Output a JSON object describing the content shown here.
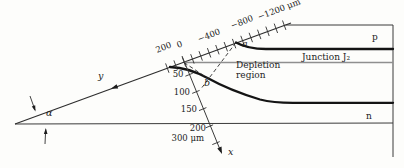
{
  "figure": {
    "background": "#fdfdfb",
    "line_color": "#2e2e2e",
    "curve_color": "#141414",
    "junction_line_color": "#8f8f8f"
  },
  "regions": {
    "p_label": "p",
    "n_label": "n",
    "junction_label": "Junction J₂",
    "depletion_label_line1": "Depletion",
    "depletion_label_line2": "region"
  },
  "bevel_axis": {
    "axis_label": "y",
    "tick_labels": [
      "200",
      "0",
      "−400",
      "−800",
      "−1200 μm"
    ]
  },
  "depth_axis": {
    "axis_label": "x",
    "tick_labels": [
      "50",
      "100",
      "150",
      "200",
      "300 μm"
    ]
  },
  "angle": {
    "label": "α"
  },
  "points": {
    "a": "a",
    "b": "b"
  }
}
